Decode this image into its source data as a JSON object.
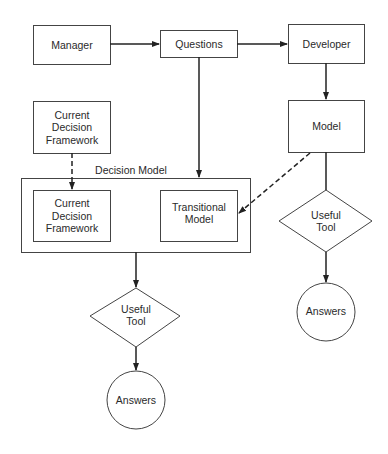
{
  "diagram": {
    "nodes": {
      "manager": {
        "label": "Manager",
        "shape": "rect"
      },
      "questions": {
        "label": "Questions",
        "shape": "rect"
      },
      "developer": {
        "label": "Developer",
        "shape": "rect"
      },
      "current_framework_top": {
        "label": "Current\nDecision\nFramework",
        "shape": "rect"
      },
      "model": {
        "label": "Model",
        "shape": "rect"
      },
      "decision_model": {
        "label": "Decision Model",
        "shape": "group"
      },
      "current_framework_inner": {
        "label": "Current\nDecision\nFramework",
        "shape": "rect"
      },
      "transitional_model": {
        "label": "Transitional\nModel",
        "shape": "rect"
      },
      "useful_tool_right": {
        "label": "Useful\nTool",
        "shape": "diamond"
      },
      "answers_right": {
        "label": "Answers",
        "shape": "circle"
      },
      "useful_tool_left": {
        "label": "Useful\nTool",
        "shape": "diamond"
      },
      "answers_left": {
        "label": "Answers",
        "shape": "circle"
      }
    },
    "edges": [
      {
        "from": "Manager",
        "to": "Questions",
        "style": "solid"
      },
      {
        "from": "Questions",
        "to": "Developer",
        "style": "solid"
      },
      {
        "from": "Questions",
        "to": "Decision Model",
        "style": "solid"
      },
      {
        "from": "Developer",
        "to": "Model",
        "style": "solid"
      },
      {
        "from": "Current Decision Framework",
        "to": "Decision Model / Current Decision Framework",
        "style": "dashed"
      },
      {
        "from": "Model",
        "to": "Transitional Model",
        "style": "dashed"
      },
      {
        "from": "Model",
        "to": "Useful Tool (right)",
        "style": "solid"
      },
      {
        "from": "Useful Tool (right)",
        "to": "Answers (right)",
        "style": "solid"
      },
      {
        "from": "Decision Model",
        "to": "Useful Tool (left)",
        "style": "solid"
      },
      {
        "from": "Useful Tool (left)",
        "to": "Answers (left)",
        "style": "solid"
      }
    ],
    "colors": {
      "stroke": "#333333",
      "text": "#2a2a2a",
      "background": "#ffffff"
    }
  }
}
